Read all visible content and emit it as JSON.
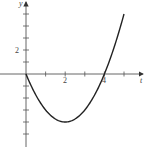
{
  "chart_data": {
    "type": "line",
    "title": "",
    "xlabel": "t",
    "ylabel": "y",
    "function": "y = t^2 - 4t",
    "x": [
      0,
      0.5,
      1,
      1.5,
      2,
      2.5,
      3,
      3.5,
      4,
      4.5,
      5
    ],
    "series": [
      {
        "name": "y",
        "values": [
          0,
          -1.75,
          -3,
          -3.75,
          -4,
          -3.75,
          -3,
          -1.75,
          0,
          2.25,
          5
        ]
      }
    ],
    "xlim": [
      -1.3,
      6
    ],
    "ylim": [
      -6,
      6
    ],
    "x_ticks": [
      1,
      2,
      3,
      4,
      5
    ],
    "x_tick_labels": {
      "2": "2",
      "4": "4"
    },
    "y_ticks": [
      -5,
      -4,
      -3,
      -2,
      -1,
      1,
      2,
      3,
      4,
      5
    ],
    "y_tick_labels": {
      "2": "2"
    },
    "grid": false,
    "legend": null,
    "line_color": "#222222",
    "axis_color": "#555555"
  },
  "labels": {
    "x_axis": "t",
    "y_axis": "y",
    "x_tick_2": "2",
    "x_tick_4": "4",
    "y_tick_2": "2"
  }
}
